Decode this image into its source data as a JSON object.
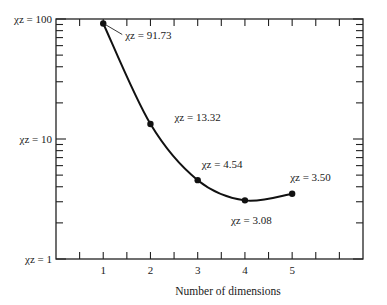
{
  "chart_data": {
    "type": "line",
    "title": "",
    "xlabel": "Number of dimensions",
    "ylabel": "",
    "yscale": "log",
    "xlim": [
      0,
      6.5
    ],
    "ylim": [
      1,
      100
    ],
    "x_ticks": [
      1,
      2,
      3,
      4,
      5
    ],
    "x_tick_labels": [
      "1",
      "2",
      "3",
      "4",
      "5"
    ],
    "y_ticks": [
      1,
      10,
      100
    ],
    "y_tick_labels": [
      "χz = 1",
      "χz = 10",
      "χz = 100"
    ],
    "grid": false,
    "legend": null,
    "series": [
      {
        "name": "χz",
        "x": [
          1,
          2,
          3,
          4,
          5
        ],
        "values": [
          91.73,
          13.32,
          4.54,
          3.08,
          3.5
        ],
        "smooth": true,
        "markers": true
      }
    ],
    "annotations": [
      {
        "text": "χz = 91.73",
        "x": 1,
        "y": 91.73
      },
      {
        "text": "χz = 13.32",
        "x": 2,
        "y": 13.32
      },
      {
        "text": "χz = 4.54",
        "x": 3,
        "y": 4.54
      },
      {
        "text": "χz = 3.08",
        "x": 4,
        "y": 3.08
      },
      {
        "text": "χz = 3.50",
        "x": 5,
        "y": 3.5
      }
    ]
  }
}
